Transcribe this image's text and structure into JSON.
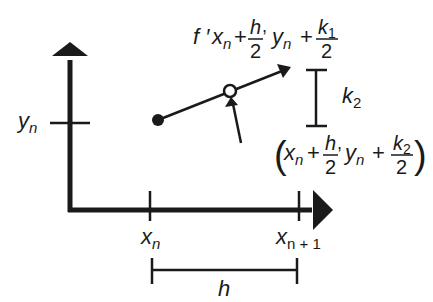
{
  "diagram": {
    "type": "runge-kutta-midpoint-step",
    "colors": {
      "ink": "#1a1a1a",
      "background": "#ffffff"
    },
    "axes": {
      "y_tick_label": {
        "var": "y",
        "sub": "n"
      },
      "x_tick_labels": [
        {
          "var": "x",
          "sub": "n"
        },
        {
          "var": "x",
          "sub": "n + 1"
        }
      ]
    },
    "step_label": "h",
    "slope_label": {
      "prefix": "f ′",
      "x": "x",
      "x_sub": "n",
      "plus1": "+",
      "frac1_num": "h",
      "frac1_den": "2",
      "comma": ",",
      "y": "y",
      "y_sub": "n",
      "plus2": "+",
      "frac2_num": "k",
      "frac2_num_sub": "1",
      "frac2_den": "2"
    },
    "increment_label": {
      "var": "k",
      "sub": "2"
    },
    "midpoint_label": {
      "open": "(",
      "x": "x",
      "x_sub": "n",
      "plus1": "+",
      "frac1_num": "h",
      "frac1_den": "2",
      "comma": ",",
      "y": "y",
      "y_sub": "n",
      "plus2": "+",
      "frac2_num": "k",
      "frac2_num_sub": "2",
      "frac2_den": "2",
      "close": ")"
    }
  }
}
